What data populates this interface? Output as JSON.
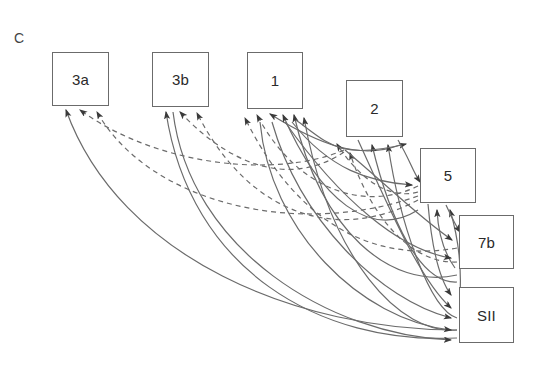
{
  "figure": {
    "panel_label": "C",
    "panel_label_pos": {
      "x": 14,
      "y": 30
    },
    "width": 547,
    "height": 376,
    "background": "#ffffff",
    "line_color": "#6b6b6b",
    "box_border_color": "#6b6b6b",
    "text_color": "#2a2a2a"
  },
  "nodes": [
    {
      "id": "3a",
      "label": "3a",
      "x": 52,
      "y": 52,
      "w": 57,
      "h": 54
    },
    {
      "id": "3b",
      "label": "3b",
      "x": 152,
      "y": 52,
      "w": 57,
      "h": 55
    },
    {
      "id": "1",
      "label": "1",
      "x": 247,
      "y": 52,
      "w": 56,
      "h": 57
    },
    {
      "id": "2",
      "label": "2",
      "x": 346,
      "y": 80,
      "w": 57,
      "h": 57
    },
    {
      "id": "5",
      "label": "5",
      "x": 420,
      "y": 148,
      "w": 56,
      "h": 55
    },
    {
      "id": "7b",
      "label": "7b",
      "x": 459,
      "y": 215,
      "w": 55,
      "h": 54
    },
    {
      "id": "SII",
      "label": "SII",
      "x": 459,
      "y": 287,
      "w": 55,
      "h": 56
    }
  ],
  "edge_styles": {
    "feedback": {
      "name": "feedback",
      "dash": "5,4",
      "color": "#6b6b6b",
      "width": 1.2
    },
    "feedforward": {
      "name": "feedforward",
      "dash": "none",
      "color": "#6b6b6b",
      "width": 1.2
    }
  },
  "edges": [
    {
      "from": "2",
      "to": "3a",
      "style": "feedback",
      "path": "M 344,150 C 280,178 160,168 80,110"
    },
    {
      "from": "5",
      "to": "3a",
      "style": "feedback",
      "path": "M 418,196 C 300,238 150,205 97,112"
    },
    {
      "from": "7b",
      "to": "3a",
      "style": "feedforward",
      "path": "M 457,330 C 300,330 120,260 66,110"
    },
    {
      "from": "2",
      "to": "3b",
      "style": "feedback",
      "path": "M 344,152 C 300,182 240,176 180,112"
    },
    {
      "from": "5",
      "to": "3b",
      "style": "feedback",
      "path": "M 418,200 C 340,242 250,218 197,113"
    },
    {
      "from": "SII",
      "to": "3b",
      "style": "feedforward",
      "path": "M 457,338 C 320,345 190,270 166,112"
    },
    {
      "from": "5",
      "to": "1",
      "style": "feedback",
      "path": "M 418,186 C 370,210 300,196 257,115"
    },
    {
      "from": "7b",
      "to": "1",
      "style": "feedback",
      "path": "M 457,248 C 380,262 300,230 245,118"
    },
    {
      "from": "2",
      "to": "1",
      "style": "feedforward",
      "path": "M 400,145 C 360,160 320,145 270,114"
    },
    {
      "from": "5",
      "to": "1",
      "style": "feedforward",
      "path": "M 418,210 C 370,240 320,200 283,115"
    },
    {
      "from": "7b",
      "to": "1",
      "style": "feedforward",
      "path": "M 457,275 C 390,290 320,230 294,115"
    },
    {
      "from": "SII",
      "to": "1",
      "style": "feedforward",
      "path": "M 457,330 C 400,335 330,260 304,118"
    },
    {
      "from": "5",
      "to": "2",
      "style": "feedback",
      "path": "M 418,192 C 390,200 360,180 337,144"
    },
    {
      "from": "7b",
      "to": "2",
      "style": "feedback",
      "path": "M 457,262 C 410,264 370,215 350,153"
    },
    {
      "from": "7b",
      "to": "2",
      "style": "feedforward",
      "path": "M 457,282 C 420,284 390,220 372,145"
    },
    {
      "from": "SII",
      "to": "2",
      "style": "feedforward",
      "path": "M 457,318 C 430,310 400,225 388,145"
    },
    {
      "from": "1",
      "to": "2",
      "style": "feedforward",
      "path": "M 296,120 C 330,145 340,160 406,144"
    },
    {
      "from": "2",
      "to": "5",
      "style": "feedforward",
      "path": "M 398,140 C 410,160 412,170 420,182"
    },
    {
      "from": "1",
      "to": "5",
      "style": "feedforward",
      "path": "M 292,122 C 330,170 370,182 412,185"
    },
    {
      "from": "7b",
      "to": "5",
      "style": "feedforward",
      "path": "M 455,268 C 442,250 438,230 437,210"
    },
    {
      "from": "SII",
      "to": "5",
      "style": "feedforward",
      "path": "M 460,295 C 462,260 456,230 450,210"
    },
    {
      "from": "5",
      "to": "7b",
      "style": "feedforward",
      "path": "M 446,205 C 452,218 456,226 460,232"
    },
    {
      "from": "2",
      "to": "7b",
      "style": "feedforward",
      "path": "M 345,150 C 390,188 420,218 452,240"
    },
    {
      "from": "1",
      "to": "7b",
      "style": "feedforward",
      "path": "M 285,122 C 340,200 400,250 451,258"
    },
    {
      "from": "5",
      "to": "SII",
      "style": "feedforward",
      "path": "M 428,204 C 432,250 440,280 451,295"
    },
    {
      "from": "2",
      "to": "SII",
      "style": "feedforward",
      "path": "M 358,140 C 390,210 420,280 451,308"
    },
    {
      "from": "1",
      "to": "SII",
      "style": "feedforward",
      "path": "M 272,122 C 300,220 380,300 451,318"
    },
    {
      "from": "1",
      "to": "SII",
      "style": "feedforward",
      "path": "M 260,122 C 270,230 360,320 451,330"
    },
    {
      "from": "3b",
      "to": "SII",
      "style": "feedforward",
      "path": "M 173,112 C 190,250 330,335 451,340"
    }
  ]
}
